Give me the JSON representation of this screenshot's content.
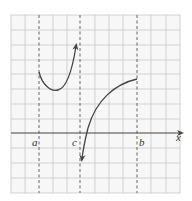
{
  "figure": {
    "width": 192,
    "height": 201,
    "grid": {
      "left": 11,
      "right": 180,
      "top": 15,
      "bottom": 193,
      "cols": 12,
      "rows": 12,
      "color": "#c8c8c8",
      "background": "#f7f7f7"
    },
    "axis": {
      "y": 133,
      "color": "#444444",
      "label": "x"
    },
    "asymptotes": [
      {
        "name": "a",
        "x": 39,
        "label": "a"
      },
      {
        "name": "c",
        "x": 80,
        "label": "c"
      },
      {
        "name": "b",
        "x": 137,
        "label": "b"
      }
    ],
    "curves": [
      {
        "name": "left-branch",
        "description": "starts at x=a, dips to a minimum, rises toward asymptote at x=c with upward arrow"
      },
      {
        "name": "right-branch",
        "description": "ends at x=b, decreases leftward, crosses x-axis, descends toward asymptote at x=c with downward arrow"
      }
    ],
    "curve_color": "#444444"
  }
}
